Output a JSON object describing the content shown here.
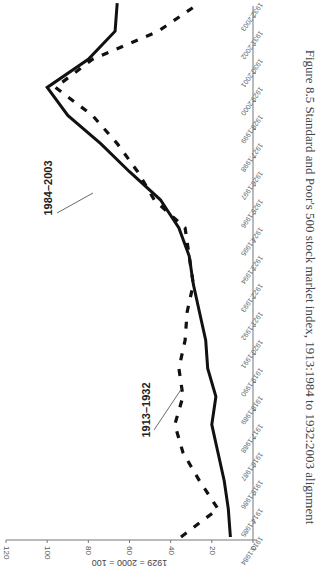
{
  "figure": {
    "caption": "Figure 8.5  Standard and Poor's 500 stock market index, 1913:1984 to 1932:2003 alignment"
  },
  "chart_data": {
    "type": "line",
    "title": "",
    "xlabel": "",
    "ylabel": "1929 = 2000 = 100",
    "ylim": [
      0,
      120
    ],
    "yticks": [
      0,
      20,
      40,
      60,
      80,
      100,
      120
    ],
    "grid": false,
    "legend": "inline labels",
    "orientation": "rotated 90° clockwise on page",
    "categories": [
      "1913:1984",
      "1914:1985",
      "1915:1986",
      "1916:1987",
      "1917:1988",
      "1918:1989",
      "1919:1990",
      "1920:1991",
      "1921:1992",
      "1922:1993",
      "1923:1994",
      "1924:1995",
      "1925:1996",
      "1926:1997",
      "1927:1998",
      "1928:1999",
      "1929:2000",
      "1930:2001",
      "1931:2002",
      "1932:2003"
    ],
    "series": [
      {
        "name": "1984–2003",
        "style": "solid",
        "values": [
          11,
          12,
          14,
          17,
          20,
          18,
          22,
          23,
          26,
          29,
          31,
          36,
          45,
          60,
          74,
          90,
          100,
          80,
          67,
          66
        ]
      },
      {
        "name": "1913–1932",
        "style": "dashed",
        "values": [
          35,
          17,
          26,
          34,
          38,
          34,
          36,
          33,
          32,
          29,
          31,
          33,
          48,
          56,
          66,
          78,
          96,
          78,
          46,
          26
        ]
      }
    ]
  },
  "labels": {
    "series_a": "1984–2003",
    "series_b": "1913–1932"
  }
}
